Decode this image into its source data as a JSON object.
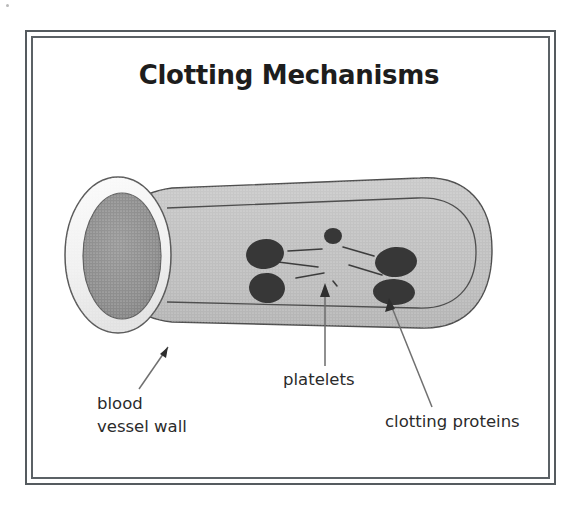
{
  "figure": {
    "title": "Clotting Mechanisms",
    "frame": {
      "outer_border_color": "#555b5f",
      "inner_border_color": "#5b6165",
      "background_color": "#ffffff"
    },
    "colors": {
      "vessel_wall_fill": "#f2f2f2",
      "vessel_body_fill": "#c3c3c3",
      "vessel_lumen_fill": "#8e8e8e",
      "outline": "#4a4a4a",
      "platelet_fill": "#3a3a3a",
      "fiber_color": "#3d3d3d",
      "leader_line_color": "#6e6e6e",
      "text_color": "#2b2b2b"
    },
    "labels": [
      {
        "name": "blood-vessel-wall",
        "lines": [
          "blood",
          "vessel wall"
        ],
        "leader": "arrow pointing up-right to vessel wall edge"
      },
      {
        "name": "platelets",
        "lines": [
          "platelets"
        ],
        "leader": "vertical arrow pointing up to platelet cluster"
      },
      {
        "name": "clotting-proteins",
        "lines": [
          "clotting proteins"
        ],
        "leader": "arrow pointing up-left to clotting protein blobs"
      }
    ],
    "label_text": {
      "blood_line1": "blood",
      "blood_line2": "vessel wall",
      "platelets": "platelets",
      "clotting_proteins": "clotting proteins"
    },
    "structures": {
      "vessel": "cut-away cylindrical blood vessel, open elliptical end at left, rounded closed end at right",
      "lumen": "dark gray interior of the vessel opening",
      "platelet_count": 5,
      "fiber_count": 6
    }
  }
}
